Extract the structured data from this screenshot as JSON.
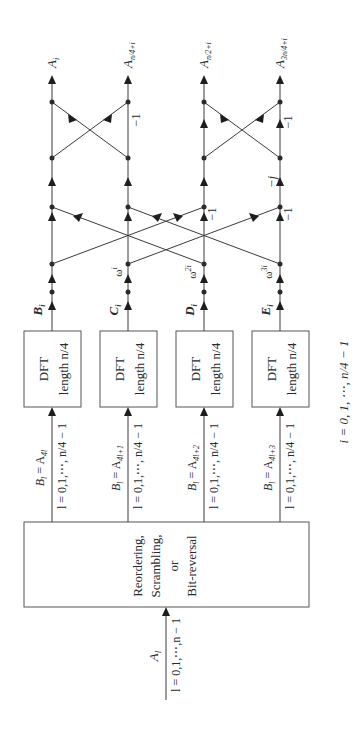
{
  "diagram": {
    "input": {
      "signal": "A",
      "subscript": "l",
      "range": "l = 0,1,⋯,n − 1"
    },
    "reorder_block": {
      "lines": [
        "Reordering,",
        "Scrambling,",
        "or",
        "Bit-reversal"
      ]
    },
    "branches": [
      {
        "assign_lhs": "B",
        "assign_lhs_sub": "l",
        "assign_rhs": "= A",
        "assign_rhs_sub": "4l",
        "range": "l = 0,1,⋯, n/4 − 1",
        "dft_line1": "DFT",
        "dft_line2": "length n/4",
        "output": "B",
        "output_sub": "i",
        "twiddle": "",
        "twiddle_sup": ""
      },
      {
        "assign_lhs": "B",
        "assign_lhs_sub": "l",
        "assign_rhs": "= A",
        "assign_rhs_sub": "4l+1",
        "range": "l = 0,1,⋯, n/4 − 1",
        "dft_line1": "DFT",
        "dft_line2": "length n/4",
        "output": "C",
        "output_sub": "i",
        "twiddle": "ω",
        "twiddle_sup": "i"
      },
      {
        "assign_lhs": "B",
        "assign_lhs_sub": "l",
        "assign_rhs": "= A",
        "assign_rhs_sub": "4l+2",
        "range": "l = 0,1,⋯, n/4 − 1",
        "dft_line1": "DFT",
        "dft_line2": "length n/4",
        "output": "D",
        "output_sub": "i",
        "twiddle": "ω",
        "twiddle_sup": "2i"
      },
      {
        "assign_lhs": "B",
        "assign_lhs_sub": "l",
        "assign_rhs": "= A",
        "assign_rhs_sub": "4l+3",
        "range": "l = 0,1,⋯, n/4 − 1",
        "dft_line1": "DFT",
        "dft_line2": "length n/4",
        "output": "E",
        "output_sub": "i",
        "twiddle": "ω",
        "twiddle_sup": "3i"
      }
    ],
    "stage1_labels": [
      "−1",
      "−1"
    ],
    "stage2_labels": [
      "−j"
    ],
    "stage3_labels": [
      "−1",
      "−1"
    ],
    "outputs": [
      {
        "name": "A",
        "sub": "i"
      },
      {
        "name": "A",
        "sub": "n/4+i"
      },
      {
        "name": "A",
        "sub": "n/2+i"
      },
      {
        "name": "A",
        "sub": "3n/4+i"
      }
    ],
    "footer": "i = 0, 1, ⋯, n/4 − 1"
  }
}
